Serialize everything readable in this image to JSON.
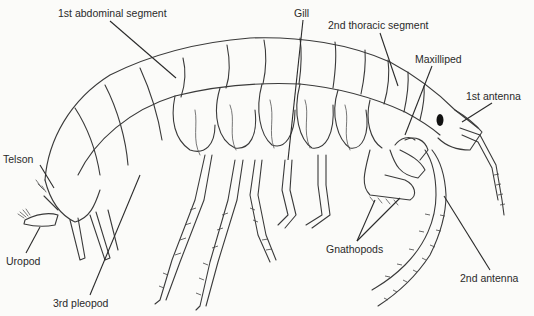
{
  "figure": {
    "labels": [
      {
        "id": "first-abdominal-segment",
        "text": "1st abdominal segment",
        "x": 58,
        "y": 7
      },
      {
        "id": "gill",
        "text": "Gill",
        "x": 294,
        "y": 7
      },
      {
        "id": "second-thoracic-segment",
        "text": "2nd thoracic segment",
        "x": 328,
        "y": 19
      },
      {
        "id": "maxilliped",
        "text": "Maxilliped",
        "x": 415,
        "y": 53
      },
      {
        "id": "first-antenna",
        "text": "1st antenna",
        "x": 466,
        "y": 90
      },
      {
        "id": "telson",
        "text": "Telson",
        "x": 3,
        "y": 153
      },
      {
        "id": "uropod",
        "text": "Uropod",
        "x": 6,
        "y": 255
      },
      {
        "id": "third-pleopod",
        "text": "3rd pleopod",
        "x": 53,
        "y": 297
      },
      {
        "id": "gnathopods",
        "text": "Gnathopods",
        "x": 326,
        "y": 243
      },
      {
        "id": "second-antenna",
        "text": "2nd antenna",
        "x": 460,
        "y": 272
      }
    ],
    "colors": {
      "background": "#fbfbf9",
      "ink": "#2a2a2a"
    }
  }
}
